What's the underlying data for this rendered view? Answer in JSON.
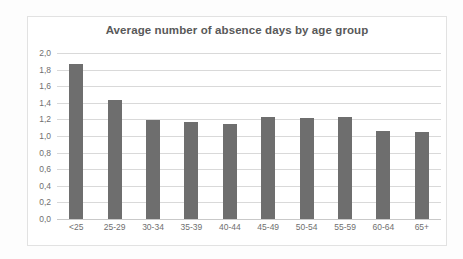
{
  "chart_data": {
    "type": "bar",
    "title": "Average number of absence days by age group",
    "xlabel": "",
    "ylabel": "",
    "categories": [
      "<25",
      "25-29",
      "30-34",
      "35-39",
      "40-44",
      "45-49",
      "50-54",
      "55-59",
      "60-64",
      "65+"
    ],
    "values": [
      1.87,
      1.43,
      1.19,
      1.17,
      1.15,
      1.23,
      1.22,
      1.23,
      1.06,
      1.05
    ],
    "value_labels": [
      "1,87",
      "1,43",
      "1,19",
      "1,17",
      "1,15",
      "1,23",
      "1,22",
      "1,23",
      "1,06",
      "1,05"
    ],
    "ylim": [
      0,
      2.0
    ],
    "ytick_values": [
      2.0,
      1.8,
      1.6,
      1.4,
      1.2,
      1.0,
      0.8,
      0.6,
      0.4,
      0.2,
      0.0
    ],
    "ytick_labels": [
      "2,0",
      "1,8",
      "1,6",
      "1,4",
      "1,2",
      "1,0",
      "0,8",
      "0,6",
      "0,4",
      "0,2",
      "0,0"
    ],
    "grid": true,
    "legend": false,
    "decimal_separator": ",",
    "series_color": "#6e6e6e",
    "gridline_color": "#d9d9d9",
    "title_color": "#595959",
    "tick_label_color": "#6f6f6f",
    "plot_background": "#ffffff",
    "border_color": "#e2e2e2"
  }
}
